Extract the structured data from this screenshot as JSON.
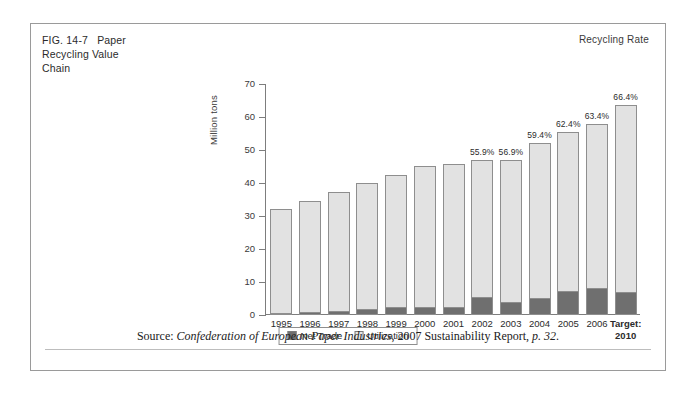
{
  "figure": {
    "number": "FIG. 14-7",
    "title": "Paper Recycling Value Chain",
    "title_line1": "Paper",
    "title_line2": "Recycling Value",
    "title_line3": "Chain",
    "corner_label": "Recycling Rate"
  },
  "source": {
    "prefix": "Source: ",
    "publisher": "Confederation of European Paper Industries",
    "middle": ", 2007 Sustainability Report, ",
    "page": "p. 32",
    "suffix": "."
  },
  "legend": {
    "items": [
      {
        "label": "Net Trade",
        "color": "#6f6f6f"
      },
      {
        "label": "Utilization",
        "color": "#e6e6e6"
      }
    ]
  },
  "chart_data": {
    "type": "bar",
    "stacked": true,
    "title": "Paper Recycling Value Chain",
    "xlabel": "",
    "ylabel": "Million tons",
    "ylim": [
      0,
      70
    ],
    "yticks": [
      0,
      10,
      20,
      30,
      40,
      50,
      60,
      70
    ],
    "grid": false,
    "legend_position": "bottom-center",
    "categories": [
      "1995",
      "1996",
      "1997",
      "1998",
      "1999",
      "2000",
      "2001",
      "2002",
      "2003",
      "2004",
      "2005",
      "2006",
      "Target: 2010"
    ],
    "category_lines": [
      [
        "1995"
      ],
      [
        "1996"
      ],
      [
        "1997"
      ],
      [
        "1998"
      ],
      [
        "1999"
      ],
      [
        "2000"
      ],
      [
        "2001"
      ],
      [
        "2002"
      ],
      [
        "2003"
      ],
      [
        "2004"
      ],
      [
        "2005"
      ],
      [
        "2006"
      ],
      [
        "Target:",
        "2010"
      ]
    ],
    "series": [
      {
        "name": "Net Trade",
        "color": "#6f6f6f",
        "values": [
          0.3,
          0.5,
          1.0,
          1.4,
          2.2,
          2.0,
          2.2,
          5.2,
          3.5,
          5.0,
          7.0,
          8.0,
          6.8
        ]
      },
      {
        "name": "Utilization",
        "color": "#e2e2e2",
        "values": [
          31.7,
          34.0,
          36.2,
          38.6,
          40.3,
          43.2,
          43.5,
          41.8,
          43.4,
          47.0,
          48.5,
          50.0,
          56.7
        ]
      }
    ],
    "totals": [
      32.0,
      34.5,
      37.2,
      40.0,
      42.5,
      45.2,
      45.7,
      47.0,
      46.9,
      52.0,
      55.5,
      58.0,
      63.5
    ],
    "data_labels": {
      "name": "Recycling Rate",
      "values": [
        null,
        null,
        null,
        null,
        null,
        null,
        null,
        "55.9%",
        "56.9%",
        "59.4%",
        "62.4%",
        "63.4%",
        "66.4%"
      ]
    }
  }
}
